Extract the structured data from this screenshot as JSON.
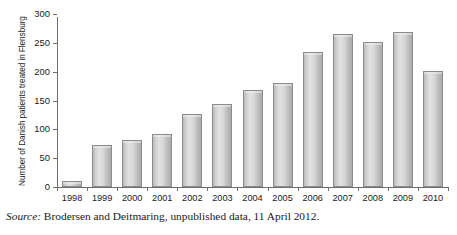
{
  "figure": {
    "ylabel": "Number of Danish patients treated in Flensburg",
    "source_word": "Source:",
    "source_text": " Brodersen and Deitmaring, unpublished data, 11 April 2012."
  },
  "chart_data": {
    "type": "bar",
    "title": "",
    "xlabel": "",
    "ylabel": "Number of Danish patients treated in Flensburg",
    "categories": [
      "1998",
      "1999",
      "2000",
      "2001",
      "2002",
      "2003",
      "2004",
      "2005",
      "2006",
      "2007",
      "2008",
      "2009",
      "2010"
    ],
    "values": [
      10,
      72,
      82,
      92,
      126,
      144,
      169,
      181,
      234,
      266,
      251,
      269,
      202
    ],
    "ylim": [
      0,
      300
    ],
    "yticks": [
      0,
      50,
      100,
      150,
      200,
      250,
      300
    ],
    "ytick_labels": [
      "0",
      "50",
      "100",
      "150",
      "200",
      "250",
      "300"
    ],
    "grid": false,
    "legend": null,
    "bar_color": "#cfcfcf",
    "bar_edge_color": "#8c8c8c",
    "axis_color": "#6e6e6e"
  }
}
